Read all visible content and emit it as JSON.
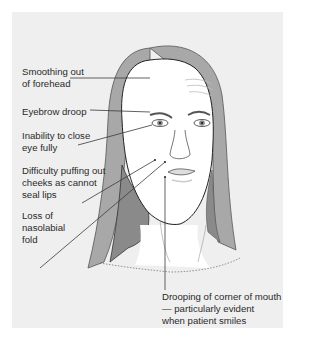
{
  "diagram": {
    "background_color": "#efefef",
    "hair_color": "#a8a8a8",
    "hair_shadow_color": "#8a8a8a",
    "line_color": "#3a3a3a",
    "labels": [
      {
        "id": "forehead",
        "text": "Smoothing out\nof forehead"
      },
      {
        "id": "eyebrow",
        "text": "Eyebrow droop"
      },
      {
        "id": "eye",
        "text": "Inability to close\neye fully"
      },
      {
        "id": "cheeks",
        "text": "Difficulty puffing out\ncheeks as cannot\nseal lips"
      },
      {
        "id": "nasolabial",
        "text": "Loss of\nnasolabial\nfold"
      },
      {
        "id": "mouth",
        "text": "Drooping of corner of mouth\n— particularly evident\n   when patient smiles"
      }
    ]
  }
}
